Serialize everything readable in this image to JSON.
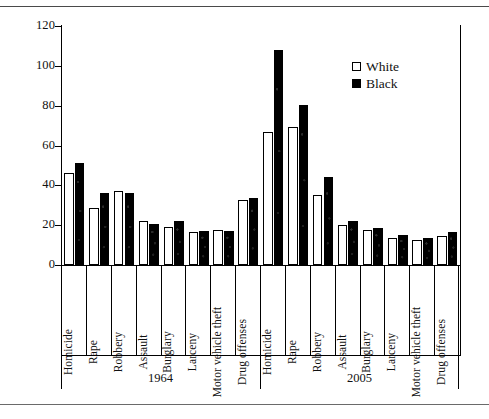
{
  "chart_data": {
    "type": "bar",
    "title": "",
    "xlabel": "",
    "ylabel": "Median time served (months)",
    "ylim": [
      0,
      120
    ],
    "yticks": [
      0,
      20,
      40,
      60,
      80,
      100,
      120
    ],
    "grid": false,
    "legend_position": "top-right",
    "groups": [
      "1964",
      "2005"
    ],
    "categories": [
      "Homicide",
      "Rape",
      "Robbery",
      "Assault",
      "Burglary",
      "Larceny",
      "Motor vehicle theft",
      "Drug offenses"
    ],
    "series": [
      {
        "name": "White",
        "color": "#ffffff",
        "values_1964": [
          46,
          28.5,
          37,
          22,
          19,
          16.5,
          17.5,
          32.5
        ],
        "values_2005": [
          67,
          69.5,
          35,
          20,
          17.5,
          13.5,
          12.5,
          14.5
        ]
      },
      {
        "name": "Black",
        "color": "#000000",
        "values_1964": [
          51,
          36,
          36,
          20.5,
          22,
          17,
          17,
          33.5
        ],
        "values_2005": [
          108,
          80.5,
          44,
          22,
          18.5,
          15,
          13.5,
          16.5
        ]
      }
    ]
  },
  "legend": {
    "items": [
      {
        "label": "White",
        "swatch": "open-square"
      },
      {
        "label": "Black",
        "swatch": "filled-square"
      }
    ]
  }
}
